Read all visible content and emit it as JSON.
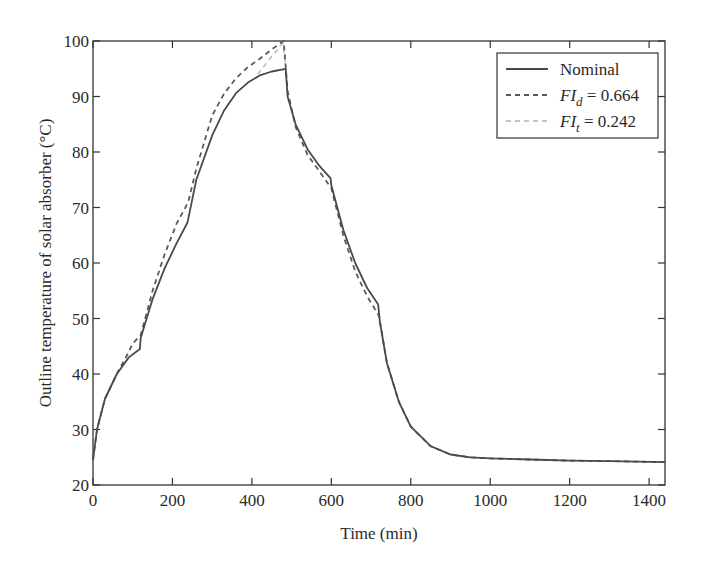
{
  "chart_data": {
    "type": "line",
    "title": "",
    "xlabel": "Time (min)",
    "ylabel": "Outline temperature of solar absorber (°C)",
    "xlim": [
      0,
      1440
    ],
    "ylim": [
      20,
      100
    ],
    "grid": false,
    "legend_position": "upper right",
    "x_ticks": [
      0,
      200,
      400,
      600,
      800,
      1000,
      1200,
      1400
    ],
    "y_ticks": [
      20,
      30,
      40,
      50,
      60,
      70,
      80,
      90,
      100
    ],
    "series": [
      {
        "name": "Nominal",
        "style": "solid",
        "color": "#4a4a4a",
        "x": [
          0,
          10,
          30,
          60,
          90,
          118,
          120,
          150,
          180,
          210,
          238,
          240,
          260,
          300,
          330,
          360,
          390,
          420,
          450,
          485,
          490,
          510,
          540,
          570,
          598,
          600,
          630,
          660,
          690,
          718,
          722,
          740,
          770,
          800,
          850,
          900,
          950,
          1000,
          1100,
          1200,
          1300,
          1440
        ],
        "y": [
          24.5,
          30,
          35.5,
          40,
          43,
          44.5,
          46.5,
          53.5,
          59,
          63.5,
          67.3,
          68,
          75,
          83,
          87.5,
          90.6,
          92.5,
          93.8,
          94.5,
          95,
          90,
          85,
          80.5,
          77.5,
          75.3,
          74,
          66,
          60,
          55.5,
          52.5,
          49.5,
          42,
          35,
          30.5,
          27,
          25.5,
          25,
          24.8,
          24.6,
          24.4,
          24.3,
          24.1
        ]
      },
      {
        "name": "FI_d = 0.664",
        "label_main": "FI",
        "label_sub": "d",
        "label_value": " = 0.664",
        "style": "dashed",
        "color": "#5a5a5a",
        "x": [
          0,
          10,
          30,
          60,
          90,
          100,
          120,
          150,
          180,
          210,
          240,
          260,
          300,
          330,
          360,
          390,
          420,
          450,
          480,
          490,
          510,
          540,
          570,
          600,
          630,
          660,
          690,
          720,
          740,
          770,
          800,
          850,
          900,
          950,
          1000,
          1100,
          1200,
          1300,
          1440
        ],
        "y": [
          24.5,
          30,
          35.5,
          40,
          44,
          45.5,
          47,
          55,
          61.5,
          67,
          71,
          77,
          86.6,
          90.5,
          93.3,
          95.3,
          96.8,
          98.5,
          100,
          91,
          84.5,
          79.5,
          76.5,
          73.5,
          65,
          58.5,
          54,
          50.5,
          42,
          35,
          30.5,
          27,
          25.5,
          25,
          24.8,
          24.6,
          24.4,
          24.3,
          24.1
        ]
      },
      {
        "name": "FI_t = 0.242",
        "label_main": "FI",
        "label_sub": "t",
        "label_value": " = 0.242",
        "style": "dashed",
        "color": "#c4c4c4",
        "x": [
          415,
          445,
          478,
          486
        ],
        "y": [
          94,
          96.8,
          99.6,
          95
        ]
      }
    ]
  },
  "axes": {
    "xlabel": "Time (min)",
    "ylabel": "Outline temperature of solar absorber (°C)"
  },
  "legend": {
    "items": [
      {
        "main": "Nominal",
        "sub": "",
        "value": ""
      },
      {
        "main": "FI",
        "sub": "d",
        "value": " = 0.664"
      },
      {
        "main": "FI",
        "sub": "t",
        "value": " = 0.242"
      }
    ]
  }
}
